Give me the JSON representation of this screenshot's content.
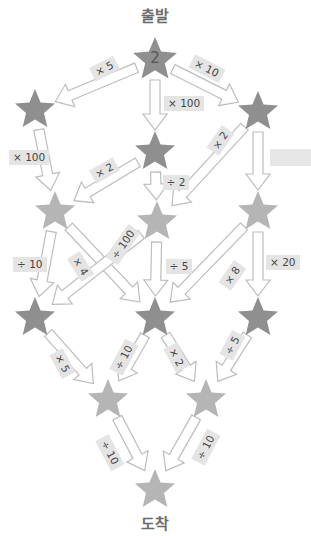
{
  "labels": {
    "start": "출발",
    "end": "도착",
    "start_value": "2"
  },
  "colors": {
    "star_dark": "#8f8f8f",
    "star_light": "#b5b5b5",
    "arrow_stroke": "#bdbdbd",
    "label_bg": "#e4e4e4"
  },
  "nodes": [
    {
      "id": "start",
      "x": 155,
      "y": 60,
      "shade": "dark",
      "value": "2"
    },
    {
      "id": "r2-left",
      "x": 35,
      "y": 110,
      "shade": "dark"
    },
    {
      "id": "r2-center",
      "x": 155,
      "y": 152,
      "shade": "dark"
    },
    {
      "id": "r2-right",
      "x": 258,
      "y": 112,
      "shade": "dark"
    },
    {
      "id": "r3-left",
      "x": 55,
      "y": 212,
      "shade": "light"
    },
    {
      "id": "r3-center",
      "x": 157,
      "y": 222,
      "shade": "light"
    },
    {
      "id": "r3-right",
      "x": 258,
      "y": 212,
      "shade": "light"
    },
    {
      "id": "r4-left",
      "x": 35,
      "y": 318,
      "shade": "dark"
    },
    {
      "id": "r4-center",
      "x": 155,
      "y": 318,
      "shade": "dark"
    },
    {
      "id": "r4-right",
      "x": 258,
      "y": 318,
      "shade": "dark"
    },
    {
      "id": "r5-left",
      "x": 108,
      "y": 400,
      "shade": "light"
    },
    {
      "id": "r5-right",
      "x": 206,
      "y": 400,
      "shade": "light"
    },
    {
      "id": "end",
      "x": 155,
      "y": 490,
      "shade": "light"
    }
  ],
  "edges": [
    {
      "from": "start",
      "to": "r2-left",
      "op": "× 5",
      "lx": 104,
      "ly": 68,
      "rot": -27
    },
    {
      "from": "start",
      "to": "r2-center",
      "op": "× 100",
      "lx": 184,
      "ly": 103,
      "rot": 0
    },
    {
      "from": "start",
      "to": "r2-right",
      "op": "× 10",
      "lx": 207,
      "ly": 68,
      "rot": 27
    },
    {
      "from": "r2-left",
      "to": "r3-left",
      "op": "× 100",
      "lx": 29,
      "ly": 157,
      "rot": 0
    },
    {
      "from": "r2-center",
      "to": "r3-left",
      "op": "× 2",
      "lx": 104,
      "ly": 170,
      "rot": -30
    },
    {
      "from": "r2-center",
      "to": "r3-center",
      "op": "÷ 2",
      "lx": 176,
      "ly": 182,
      "rot": 0
    },
    {
      "from": "r2-right",
      "to": "r3-center",
      "op": "× 2",
      "lx": 220,
      "ly": 140,
      "rot": -55
    },
    {
      "from": "r2-right",
      "to": "r3-right",
      "op": "",
      "lx": 290,
      "ly": 157,
      "rot": 0,
      "blank": true
    },
    {
      "from": "r3-left",
      "to": "r4-left",
      "op": "÷ 10",
      "lx": 30,
      "ly": 264,
      "rot": 0
    },
    {
      "from": "r3-left",
      "to": "r4-center",
      "op": "× 4",
      "lx": 80,
      "ly": 266,
      "rot": 58
    },
    {
      "from": "r3-center",
      "to": "r4-left",
      "op": "÷ 100",
      "lx": 123,
      "ly": 244,
      "rot": -55
    },
    {
      "from": "r3-center",
      "to": "r4-center",
      "op": "÷ 5",
      "lx": 179,
      "ly": 266,
      "rot": 0
    },
    {
      "from": "r3-right",
      "to": "r4-center",
      "op": "× 8",
      "lx": 232,
      "ly": 275,
      "rot": -55
    },
    {
      "from": "r3-right",
      "to": "r4-right",
      "op": "× 20",
      "lx": 283,
      "ly": 262,
      "rot": 0
    },
    {
      "from": "r4-left",
      "to": "r5-left",
      "op": "× 5",
      "lx": 62,
      "ly": 363,
      "rot": 62
    },
    {
      "from": "r4-center",
      "to": "r5-left",
      "op": "÷ 10",
      "lx": 124,
      "ly": 357,
      "rot": -62
    },
    {
      "from": "r4-center",
      "to": "r5-right",
      "op": "× 2",
      "lx": 176,
      "ly": 357,
      "rot": 62
    },
    {
      "from": "r4-right",
      "to": "r5-right",
      "op": "÷ 5",
      "lx": 232,
      "ly": 345,
      "rot": -62
    },
    {
      "from": "r5-left",
      "to": "end",
      "op": "÷ 10",
      "lx": 110,
      "ly": 452,
      "rot": 62
    },
    {
      "from": "r5-right",
      "to": "end",
      "op": "÷ 10",
      "lx": 206,
      "ly": 447,
      "rot": -62
    }
  ]
}
